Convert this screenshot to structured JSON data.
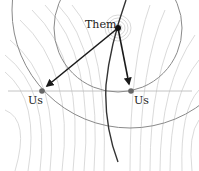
{
  "diagram": {
    "labels": {
      "them": "Them",
      "us_left": "Us",
      "us_right": "Us"
    },
    "points": {
      "them": {
        "x": 118,
        "y": 28
      },
      "us_left": {
        "x": 42,
        "y": 91
      },
      "us_right": {
        "x": 131,
        "y": 91
      }
    },
    "colors": {
      "arrow": "#1a1a1a",
      "point_us": "#666666",
      "point_them": "#111111",
      "circle": "#888888",
      "fan_lines": "#d4d4d4",
      "worldline": "#333333",
      "horizon": "#bbbbbb"
    }
  }
}
